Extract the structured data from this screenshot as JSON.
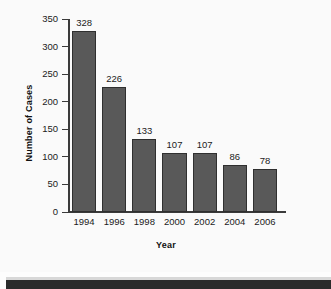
{
  "chart_data": {
    "type": "bar",
    "title": "",
    "xlabel": "Year",
    "ylabel": "Number of Cases",
    "categories": [
      "1994",
      "1996",
      "1998",
      "2000",
      "2002",
      "2004",
      "2006"
    ],
    "values": [
      328,
      226,
      133,
      107,
      107,
      86,
      78
    ],
    "value_labels": [
      "328",
      "226",
      "133",
      "107",
      "107",
      "86",
      "78"
    ],
    "ylim": [
      0,
      350
    ],
    "yticks": [
      0,
      50,
      100,
      150,
      200,
      250,
      300,
      350
    ],
    "ytick_labels": [
      "0",
      "50",
      "100",
      "150",
      "200",
      "250",
      "300",
      "350"
    ],
    "grid": false,
    "legend": false,
    "bar_color": "#595959",
    "bar_edge_color": "#2f2f2f",
    "axis_color": "#3a3a3a",
    "text_color": "#1a1a1a",
    "background_color": "#fafafa"
  },
  "figure": {
    "y_axis_title": "Number of Cases",
    "x_axis_title": "Year"
  }
}
